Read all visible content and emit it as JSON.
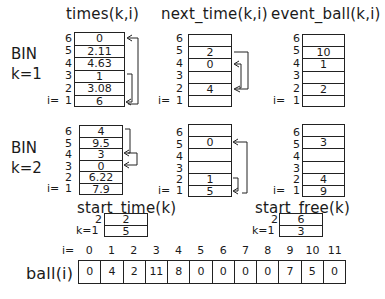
{
  "headers": {
    "times": "times(k,i)",
    "next_time": "next_time(k,i)",
    "event_ball": "event_ball(k,i)",
    "start_time": "start_time(k)",
    "start_free": "start_free(k)",
    "ball": "ball(i)"
  },
  "bins": [
    {
      "label_line1": "BIN",
      "label_line2": "k=1",
      "i_labels": [
        "6",
        "5",
        "4",
        "3",
        "2",
        "1"
      ],
      "i_prefix": "i=",
      "times": [
        "0",
        "2.11",
        "4.63",
        "1",
        "3.08",
        "6"
      ],
      "next_time": [
        "",
        "2",
        "0",
        "",
        "4",
        ""
      ],
      "event_ball": [
        "",
        "10",
        "1",
        "",
        "2",
        ""
      ]
    },
    {
      "label_line1": "BIN",
      "label_line2": "k=2",
      "i_labels": [
        "6",
        "5",
        "4",
        "3",
        "2",
        "1"
      ],
      "i_prefix": "i=",
      "times": [
        "4",
        "9.5",
        "3",
        "0",
        "6.22",
        "7.9"
      ],
      "next_time": [
        "",
        "0",
        "",
        "",
        "1",
        "5"
      ],
      "event_ball": [
        "",
        "3",
        "",
        "",
        "4",
        "9"
      ]
    }
  ],
  "start_time": {
    "k_labels": [
      "2",
      "k=1"
    ],
    "values": [
      "2",
      "5"
    ]
  },
  "start_free": {
    "k_labels": [
      "2",
      "k=1"
    ],
    "values": [
      "6",
      "3"
    ]
  },
  "ball_array": {
    "i_prefix": "i=",
    "indices": [
      "0",
      "1",
      "2",
      "3",
      "4",
      "5",
      "6",
      "7",
      "8",
      "9",
      "10",
      "11"
    ],
    "values": [
      "0",
      "4",
      "2",
      "11",
      "8",
      "0",
      "0",
      "0",
      "0",
      "7",
      "5",
      "0"
    ]
  }
}
